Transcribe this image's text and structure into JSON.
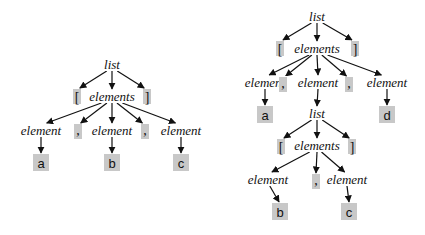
{
  "diagram": {
    "type": "parse-tree-figure",
    "colors": {
      "terminal_box": "#c8c8c8",
      "ink": "#111111",
      "background": "#ffffff"
    },
    "trees": [
      {
        "name": "parse-tree-abc",
        "nodes": [
          {
            "id": "l0",
            "label": "list",
            "kind": "nonterminal"
          },
          {
            "id": "lb",
            "label": "[",
            "kind": "punct"
          },
          {
            "id": "e0",
            "label": "elements",
            "kind": "nonterminal"
          },
          {
            "id": "rb",
            "label": "]",
            "kind": "punct"
          },
          {
            "id": "el1",
            "label": "element",
            "kind": "nonterminal"
          },
          {
            "id": "c1",
            "label": ",",
            "kind": "punct"
          },
          {
            "id": "el2",
            "label": "element",
            "kind": "nonterminal"
          },
          {
            "id": "c2",
            "label": ",",
            "kind": "punct"
          },
          {
            "id": "el3",
            "label": "element",
            "kind": "nonterminal"
          },
          {
            "id": "ta",
            "label": "a",
            "kind": "terminal"
          },
          {
            "id": "tb",
            "label": "b",
            "kind": "terminal"
          },
          {
            "id": "tc",
            "label": "c",
            "kind": "terminal"
          }
        ],
        "edges": [
          [
            "l0",
            "lb"
          ],
          [
            "l0",
            "e0"
          ],
          [
            "l0",
            "rb"
          ],
          [
            "e0",
            "el1"
          ],
          [
            "e0",
            "c1"
          ],
          [
            "e0",
            "el2"
          ],
          [
            "e0",
            "c2"
          ],
          [
            "e0",
            "el3"
          ],
          [
            "el1",
            "ta"
          ],
          [
            "el2",
            "tb"
          ],
          [
            "el3",
            "tc"
          ]
        ]
      },
      {
        "name": "parse-tree-nested",
        "nodes": [
          {
            "id": "L0",
            "label": "list",
            "kind": "nonterminal"
          },
          {
            "id": "LB",
            "label": "[",
            "kind": "punct"
          },
          {
            "id": "E0",
            "label": "elements",
            "kind": "nonterminal"
          },
          {
            "id": "RB",
            "label": "]",
            "kind": "punct"
          },
          {
            "id": "EL1",
            "label": "element",
            "kind": "nonterminal"
          },
          {
            "id": "C1",
            "label": ",",
            "kind": "punct"
          },
          {
            "id": "EL2",
            "label": "element",
            "kind": "nonterminal"
          },
          {
            "id": "C2",
            "label": ",",
            "kind": "punct"
          },
          {
            "id": "EL3",
            "label": "element",
            "kind": "nonterminal"
          },
          {
            "id": "TA",
            "label": "a",
            "kind": "terminal"
          },
          {
            "id": "TD",
            "label": "d",
            "kind": "terminal"
          },
          {
            "id": "L1",
            "label": "list",
            "kind": "nonterminal"
          },
          {
            "id": "LB2",
            "label": "[",
            "kind": "punct"
          },
          {
            "id": "E1",
            "label": "elements",
            "kind": "nonterminal"
          },
          {
            "id": "RB2",
            "label": "]",
            "kind": "punct"
          },
          {
            "id": "EL4",
            "label": "element",
            "kind": "nonterminal"
          },
          {
            "id": "C3",
            "label": ",",
            "kind": "punct"
          },
          {
            "id": "EL5",
            "label": "element",
            "kind": "nonterminal"
          },
          {
            "id": "TB",
            "label": "b",
            "kind": "terminal"
          },
          {
            "id": "TC",
            "label": "c",
            "kind": "terminal"
          }
        ],
        "edges": [
          [
            "L0",
            "LB"
          ],
          [
            "L0",
            "E0"
          ],
          [
            "L0",
            "RB"
          ],
          [
            "E0",
            "EL1"
          ],
          [
            "E0",
            "C1"
          ],
          [
            "E0",
            "EL2"
          ],
          [
            "E0",
            "C2"
          ],
          [
            "E0",
            "EL3"
          ],
          [
            "EL1",
            "TA"
          ],
          [
            "EL2",
            "L1"
          ],
          [
            "EL3",
            "TD"
          ],
          [
            "L1",
            "LB2"
          ],
          [
            "L1",
            "E1"
          ],
          [
            "L1",
            "RB2"
          ],
          [
            "E1",
            "EL4"
          ],
          [
            "E1",
            "C3"
          ],
          [
            "E1",
            "EL5"
          ],
          [
            "EL4",
            "TB"
          ],
          [
            "EL5",
            "TC"
          ]
        ]
      }
    ]
  }
}
